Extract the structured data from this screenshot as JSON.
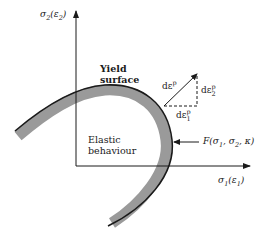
{
  "diagram": {
    "axes": {
      "y_axis_label": "σ₂(ε₂)",
      "y_axis_label_parts": {
        "main": "σ",
        "sub": "2",
        "paren_main": "ε",
        "paren_sub": "2"
      },
      "x_axis_label": "σ₁(ε₁)",
      "x_axis_label_parts": {
        "main": "σ",
        "sub": "1",
        "paren_main": "ε",
        "paren_sub": "1"
      }
    },
    "regions": {
      "yield_surface_line1": "Yield",
      "yield_surface_line2": "surface",
      "elastic_line1": "Elastic",
      "elastic_line2": "behaviour"
    },
    "vectors": {
      "total_increment": {
        "main": "dε",
        "sup": "p"
      },
      "component_2": {
        "main": "dε",
        "sup": "p",
        "sub": "2"
      },
      "component_1": {
        "main": "dε",
        "sup": "p",
        "sub": "1"
      }
    },
    "function_label": {
      "text": "F(σ₁, σ₂, κ)",
      "prefix": "F(σ",
      "sub1": "1",
      "mid": ", σ",
      "sub2": "2",
      "suffix": ", κ)"
    },
    "colors": {
      "line": "#1a1a1a",
      "band": "#9a9a9a",
      "background": "#ffffff"
    }
  }
}
